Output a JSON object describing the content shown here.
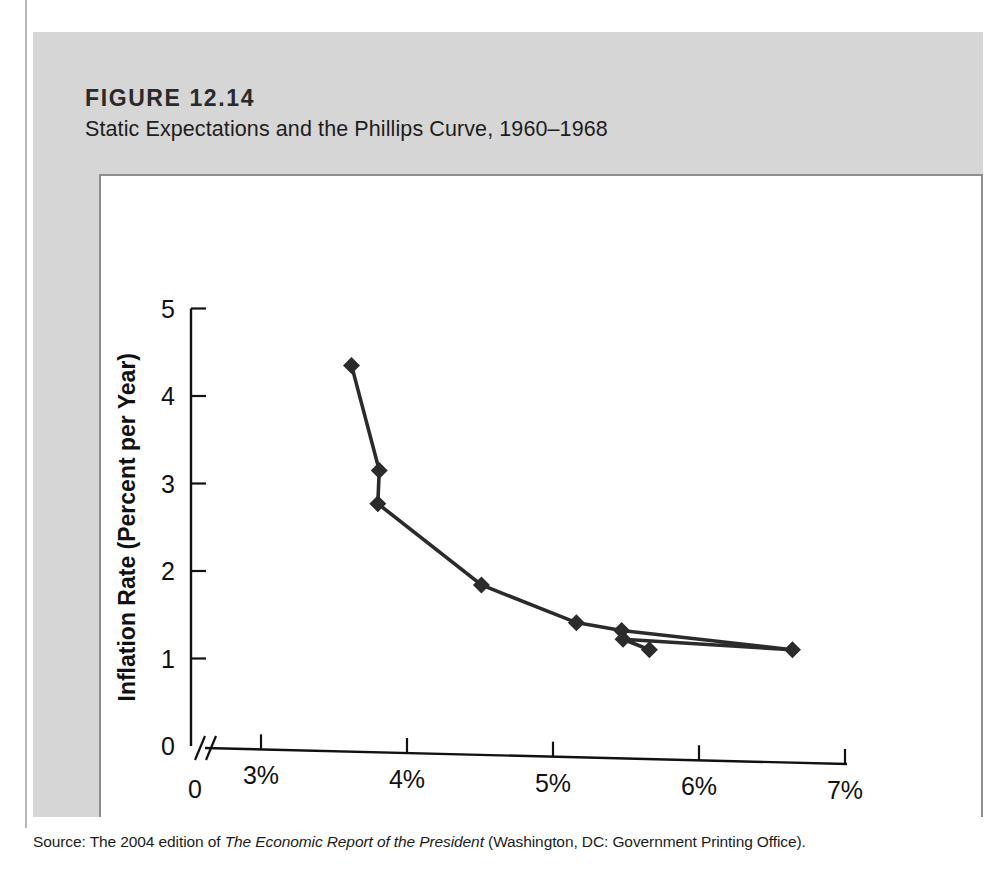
{
  "figure": {
    "number": "FIGURE 12.14",
    "subtitle": "Static Expectations and the Phillips Curve, 1960–1968",
    "source_prefix": "Source: The 2004 edition of ",
    "source_italic": "The Economic Report of the President",
    "source_suffix": " (Washington, DC: Government Printing Office).",
    "panel_color": "#d6d6d6",
    "plot_background": "#ffffff",
    "line_color": "#2b2b2b"
  },
  "chart_data": {
    "type": "line",
    "title": "Static Expectations and the Phillips Curve, 1960–1968",
    "xlabel": "Unemployment Rate",
    "ylabel": "Inflation Rate (Percent per Year)",
    "xlim": [
      2.6,
      7.0
    ],
    "ylim": [
      0,
      5
    ],
    "grid": false,
    "legend": null,
    "axis_break_x": true,
    "marker": "diamond",
    "xticks": [
      0,
      3,
      4,
      5,
      6,
      7
    ],
    "xticklabels": [
      "0",
      "3%",
      "4%",
      "5%",
      "6%",
      "7%"
    ],
    "yticks": [
      0,
      1,
      2,
      3,
      4,
      5
    ],
    "yticklabels": [
      "0",
      "1",
      "2",
      "3",
      "4",
      "5"
    ],
    "x": [
      3.62,
      3.81,
      3.8,
      4.51,
      5.16,
      5.47,
      5.48,
      5.66,
      6.64
    ],
    "values": [
      4.35,
      3.15,
      2.77,
      1.84,
      1.41,
      1.32,
      1.22,
      1.1,
      1.1
    ],
    "points": [
      {
        "x": 3.62,
        "y": 4.35
      },
      {
        "x": 3.81,
        "y": 3.15
      },
      {
        "x": 3.8,
        "y": 2.77
      },
      {
        "x": 4.51,
        "y": 1.84
      },
      {
        "x": 5.16,
        "y": 1.41
      },
      {
        "x": 5.47,
        "y": 1.32
      },
      {
        "x": 5.48,
        "y": 1.22
      },
      {
        "x": 5.66,
        "y": 1.1
      },
      {
        "x": 6.64,
        "y": 1.1
      }
    ],
    "series_order": [
      0,
      1,
      2,
      3,
      4,
      5,
      8,
      6,
      7
    ]
  }
}
